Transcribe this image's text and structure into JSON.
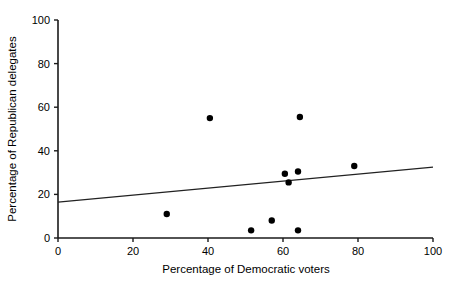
{
  "chart_data": {
    "type": "scatter",
    "title": "",
    "xlabel": "Percentage of Democratic voters",
    "ylabel": "Percentage of Republican delegates",
    "xlim": [
      0,
      100
    ],
    "ylim": [
      0,
      100
    ],
    "xticks": [
      0,
      20,
      40,
      60,
      80,
      100
    ],
    "yticks": [
      0,
      20,
      40,
      60,
      80,
      100
    ],
    "xtick_labels": [
      "0",
      "20",
      "40",
      "60",
      "80",
      "100"
    ],
    "ytick_labels": [
      "0",
      "20",
      "40",
      "60",
      "80",
      "100"
    ],
    "grid": false,
    "legend": null,
    "marker": "filled-circle",
    "marker_color": "#000000",
    "points": [
      {
        "x": 29.0,
        "y": 11.0
      },
      {
        "x": 40.5,
        "y": 55.0
      },
      {
        "x": 51.5,
        "y": 3.5
      },
      {
        "x": 57.0,
        "y": 8.0
      },
      {
        "x": 60.5,
        "y": 29.5
      },
      {
        "x": 61.5,
        "y": 25.5
      },
      {
        "x": 64.0,
        "y": 30.5
      },
      {
        "x": 64.5,
        "y": 55.5
      },
      {
        "x": 64.0,
        "y": 3.5
      },
      {
        "x": 79.0,
        "y": 33.0
      }
    ],
    "trend_line": {
      "type": "linear-fit",
      "x": [
        0,
        100
      ],
      "y": [
        16.5,
        32.5
      ],
      "color": "#222222"
    }
  }
}
